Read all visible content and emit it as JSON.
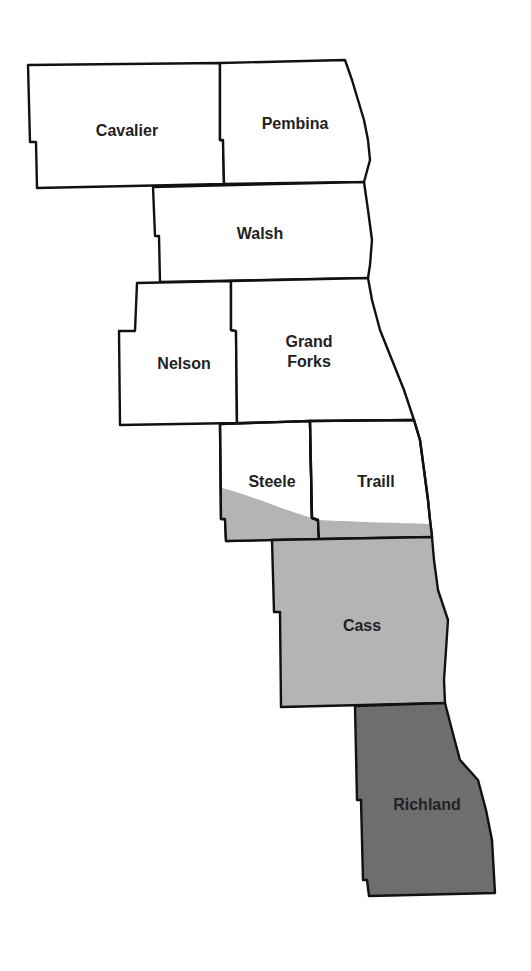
{
  "map": {
    "colors": {
      "unshaded": "#ffffff",
      "light_shade": "#b4b4b4",
      "dark_shade": "#6e6e6e",
      "border": "#111111"
    },
    "counties": [
      {
        "name": "Cavalier",
        "label": "Cavalier",
        "shade": "none"
      },
      {
        "name": "Pembina",
        "label": "Pembina",
        "shade": "none"
      },
      {
        "name": "Walsh",
        "label": "Walsh",
        "shade": "none"
      },
      {
        "name": "Nelson",
        "label": "Nelson",
        "shade": "none"
      },
      {
        "name": "Grand Forks",
        "label": "Grand\nForks",
        "shade": "none"
      },
      {
        "name": "Steele",
        "label": "Steele",
        "shade": "partial-light"
      },
      {
        "name": "Traill",
        "label": "Traill",
        "shade": "partial-light"
      },
      {
        "name": "Cass",
        "label": "Cass",
        "shade": "light"
      },
      {
        "name": "Richland",
        "label": "Richland",
        "shade": "dark"
      }
    ]
  }
}
